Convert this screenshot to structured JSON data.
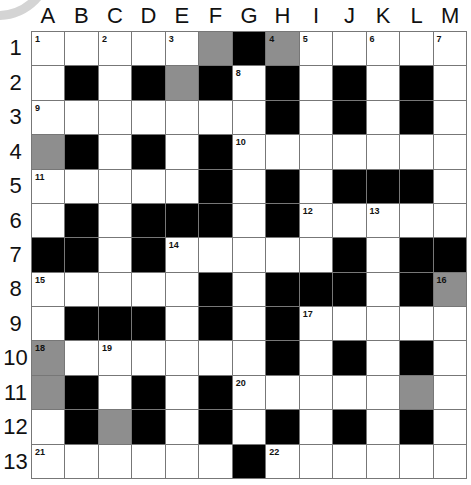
{
  "puzzle": {
    "columns": [
      "A",
      "B",
      "C",
      "D",
      "E",
      "F",
      "G",
      "H",
      "I",
      "J",
      "K",
      "L",
      "M"
    ],
    "rows": [
      "1",
      "2",
      "3",
      "4",
      "5",
      "6",
      "7",
      "8",
      "9",
      "10",
      "11",
      "12",
      "13"
    ],
    "grid": [
      [
        "W",
        "W",
        "W",
        "W",
        "W",
        "G",
        "B",
        "G",
        "W",
        "W",
        "W",
        "W",
        "W"
      ],
      [
        "W",
        "B",
        "W",
        "B",
        "G",
        "B",
        "W",
        "B",
        "W",
        "B",
        "W",
        "B",
        "W"
      ],
      [
        "W",
        "W",
        "W",
        "W",
        "W",
        "W",
        "W",
        "B",
        "W",
        "B",
        "W",
        "B",
        "W"
      ],
      [
        "G",
        "B",
        "W",
        "B",
        "W",
        "B",
        "W",
        "W",
        "W",
        "W",
        "W",
        "W",
        "W"
      ],
      [
        "W",
        "W",
        "W",
        "W",
        "W",
        "B",
        "W",
        "B",
        "W",
        "B",
        "B",
        "B",
        "W"
      ],
      [
        "W",
        "B",
        "W",
        "B",
        "B",
        "B",
        "W",
        "B",
        "W",
        "W",
        "W",
        "W",
        "W"
      ],
      [
        "B",
        "B",
        "W",
        "B",
        "W",
        "W",
        "W",
        "W",
        "W",
        "B",
        "W",
        "B",
        "B"
      ],
      [
        "W",
        "W",
        "W",
        "W",
        "W",
        "B",
        "W",
        "B",
        "B",
        "B",
        "W",
        "B",
        "G"
      ],
      [
        "W",
        "B",
        "B",
        "B",
        "W",
        "B",
        "W",
        "B",
        "W",
        "W",
        "W",
        "W",
        "W"
      ],
      [
        "G",
        "W",
        "W",
        "W",
        "W",
        "W",
        "W",
        "B",
        "W",
        "B",
        "W",
        "B",
        "W"
      ],
      [
        "G",
        "B",
        "W",
        "B",
        "W",
        "B",
        "W",
        "W",
        "W",
        "W",
        "W",
        "G",
        "W"
      ],
      [
        "W",
        "B",
        "G",
        "B",
        "W",
        "B",
        "W",
        "B",
        "W",
        "B",
        "W",
        "B",
        "W"
      ],
      [
        "W",
        "W",
        "W",
        "W",
        "W",
        "W",
        "B",
        "W",
        "W",
        "W",
        "W",
        "W",
        "W"
      ]
    ],
    "numbers": [
      {
        "r": 0,
        "c": 0,
        "n": "1"
      },
      {
        "r": 0,
        "c": 2,
        "n": "2"
      },
      {
        "r": 0,
        "c": 4,
        "n": "3"
      },
      {
        "r": 0,
        "c": 7,
        "n": "4"
      },
      {
        "r": 0,
        "c": 8,
        "n": "5"
      },
      {
        "r": 0,
        "c": 10,
        "n": "6"
      },
      {
        "r": 0,
        "c": 12,
        "n": "7"
      },
      {
        "r": 1,
        "c": 6,
        "n": "8"
      },
      {
        "r": 2,
        "c": 0,
        "n": "9"
      },
      {
        "r": 3,
        "c": 6,
        "n": "10"
      },
      {
        "r": 4,
        "c": 0,
        "n": "11"
      },
      {
        "r": 5,
        "c": 8,
        "n": "12"
      },
      {
        "r": 5,
        "c": 10,
        "n": "13"
      },
      {
        "r": 6,
        "c": 4,
        "n": "14"
      },
      {
        "r": 7,
        "c": 0,
        "n": "15"
      },
      {
        "r": 7,
        "c": 12,
        "n": "16"
      },
      {
        "r": 8,
        "c": 8,
        "n": "17"
      },
      {
        "r": 9,
        "c": 0,
        "n": "18"
      },
      {
        "r": 9,
        "c": 2,
        "n": "19"
      },
      {
        "r": 10,
        "c": 6,
        "n": "20"
      },
      {
        "r": 12,
        "c": 0,
        "n": "21"
      },
      {
        "r": 12,
        "c": 7,
        "n": "22"
      }
    ]
  }
}
